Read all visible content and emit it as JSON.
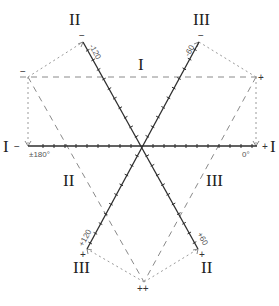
{
  "diagram": {
    "type": "hexaxial reference diagram",
    "center": {
      "x": 142,
      "y": 146
    },
    "axes": [
      {
        "name": "lead-I-axis",
        "negative_end": {
          "x": 28,
          "y": 146
        },
        "positive_end": {
          "x": 257,
          "y": 146
        },
        "negative_label": "±180°",
        "positive_label": "0°"
      },
      {
        "name": "lead-II-axis",
        "negative_end": {
          "x": 83,
          "y": 42
        },
        "positive_end": {
          "x": 198,
          "y": 249
        },
        "negative_label": "-120",
        "positive_label": "+60"
      },
      {
        "name": "lead-III-axis",
        "negative_end": {
          "x": 199,
          "y": 42
        },
        "positive_end": {
          "x": 87,
          "y": 249
        },
        "negative_label": "-60",
        "positive_label": "+120"
      }
    ],
    "lead_labels": {
      "top_left": "II",
      "top_right": "III",
      "left": "I",
      "right": "I",
      "bottom_left": "III",
      "bottom_right": "II"
    },
    "region_labels": {
      "top": "I",
      "left": "II",
      "right": "III"
    },
    "polarity_signs": {
      "top_left_axis_end": "−",
      "top_right_axis_end": "−",
      "triangle_left": "−",
      "triangle_right": "+",
      "left_axis_end": "−",
      "right_axis_end": "+",
      "bottom_left_axis_end": "+",
      "bottom_right_axis_end": "+",
      "bottom_apex": "++"
    },
    "triangle": {
      "left": {
        "x": 28,
        "y": 77
      },
      "right": {
        "x": 256,
        "y": 77
      },
      "apex": {
        "x": 144,
        "y": 282
      }
    },
    "colors": {
      "axis": "#333333",
      "dashed": "#888888",
      "dotted": "#999999"
    }
  }
}
